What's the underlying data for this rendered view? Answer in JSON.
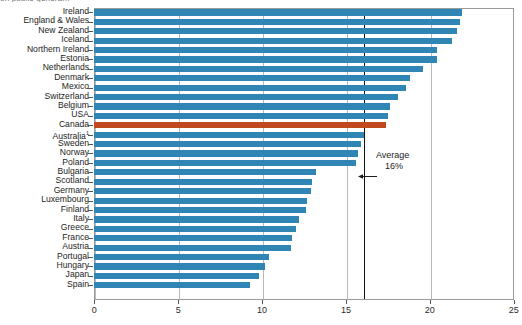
{
  "caption": "on public genera...",
  "chart_data": {
    "type": "bar",
    "orientation": "horizontal",
    "title": "",
    "xlabel": "",
    "ylabel": "",
    "xlim": [
      0,
      25
    ],
    "xticks": [
      0,
      5,
      10,
      15,
      20,
      25
    ],
    "xtick_labels": [
      "0",
      "5",
      "10",
      "15",
      "20",
      "25"
    ],
    "grid": true,
    "grid_axis": "x",
    "bar_color": "#2f86b4",
    "highlight_color": "#bf4a20",
    "highlight_category": "Canada",
    "annotation": {
      "label": "Average",
      "value_label": "16%",
      "value": 16,
      "arrow": "left-arrow-icon"
    },
    "categories": [
      "Ireland",
      "England & Wales",
      "New Zealand",
      "Iceland",
      "Northern Ireland",
      "Estonia",
      "Netherlands",
      "Denmark",
      "Mexico",
      "Switzerland",
      "Belgium",
      "USA",
      "Canada",
      "Australia",
      "Sweden",
      "Norway",
      "Poland",
      "Bulgaria",
      "Scotland",
      "Germany",
      "Luxembourg",
      "Finland",
      "Italy",
      "Greece",
      "France",
      "Austria",
      "Portugal",
      "Hungary",
      "Japan",
      "Spain"
    ],
    "footnote_markers": {
      "Australia": "1"
    },
    "values": [
      21.9,
      21.8,
      21.6,
      21.3,
      20.4,
      20.4,
      19.6,
      18.8,
      18.6,
      18.1,
      17.6,
      17.5,
      17.4,
      16.1,
      15.9,
      15.7,
      15.6,
      13.2,
      13.0,
      12.9,
      12.7,
      12.6,
      12.2,
      12.0,
      11.8,
      11.7,
      10.4,
      10.2,
      9.8,
      9.3
    ]
  }
}
